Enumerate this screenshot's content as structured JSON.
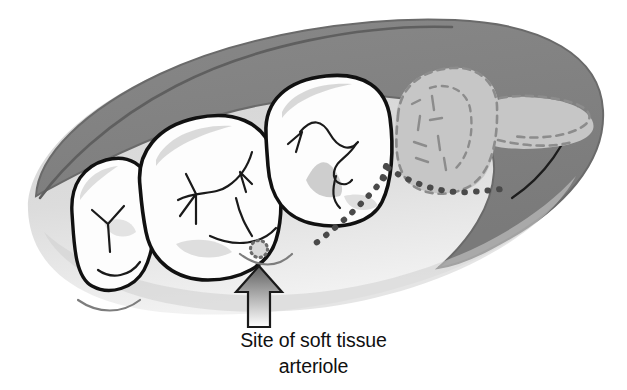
{
  "figure": {
    "name": "mandibular-arch-impacted-third-molar",
    "caption": {
      "line1": "Site of soft tissue",
      "line2": "arteriole"
    },
    "colors": {
      "background": "#ffffff",
      "gum_dark": "#808080",
      "gum_dark_edge": "#6e6e6e",
      "gum_light": "#d5d5d5",
      "gum_light_lower": "#e2e2e2",
      "tooth_fill": "#fdfdfd",
      "tooth_outline": "#111111",
      "tooth_shading": "#d2d2d2",
      "impacted_tooth_fill": "#c6c6c6",
      "impacted_tooth_dashed": "#8f8f8f",
      "incision_dots": "#4a4a4a",
      "arteriole_dots": "#6b6b6b",
      "arrow_outline": "#1a1a1a",
      "arrow_gradient_top": "#6a6a6a",
      "arrow_gradient_bottom": "#ffffff",
      "caption_text": "#101010"
    },
    "parts": {
      "ridge_label": "alveolar ridge",
      "tooth_1_label": "second premolar",
      "tooth_2_label": "first molar",
      "tooth_3_label": "second molar",
      "impacted_label": "impacted third molar",
      "incision_label": "incision line",
      "arteriole_label": "soft tissue arteriole",
      "arrow_label": "pointer arrow"
    }
  }
}
